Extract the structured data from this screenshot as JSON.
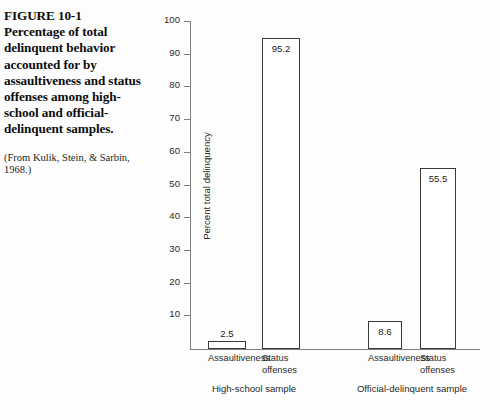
{
  "caption": {
    "figure_number": "FIGURE 10-1",
    "text": "Percentage of total delinquent behavior accounted for by assaultiveness and status offenses among high-school and official-delinquent samples.",
    "source": "(From Kulik, Stein, & Sarbin, 1968.)"
  },
  "chart_data": {
    "type": "bar",
    "title": "",
    "xlabel": "",
    "ylabel": "Percent total delinquency",
    "ylim": [
      0,
      100
    ],
    "yticks": [
      10,
      20,
      30,
      40,
      50,
      60,
      70,
      80,
      90,
      100
    ],
    "ytick_labels": [
      "10",
      "20",
      "30",
      "40",
      "50",
      "60",
      "70",
      "80",
      "90",
      "100"
    ],
    "grid": false,
    "legend": "none",
    "groups": [
      {
        "name": "High-school sample",
        "categories": [
          "Assaultiveness",
          "Status\noffenses"
        ],
        "values": [
          2.5,
          95.2
        ],
        "value_labels": [
          "2.5",
          "95.2"
        ]
      },
      {
        "name": "Official-delinquent sample",
        "categories": [
          "Assaultiveness",
          "Status\noffenses"
        ],
        "values": [
          8.6,
          55.5
        ],
        "value_labels": [
          "8.6",
          "55.5"
        ]
      }
    ],
    "categories": [
      "Assaultiveness",
      "Status offenses",
      "Assaultiveness",
      "Status offenses"
    ],
    "values": [
      2.5,
      95.2,
      8.6,
      55.5
    ],
    "colors": {
      "bar_fill": "#ffffff",
      "bar_stroke": "#3a3a3a",
      "axis": "#7d7d7d",
      "text": "#2a2a2a",
      "background": "#fdfdfd"
    }
  }
}
